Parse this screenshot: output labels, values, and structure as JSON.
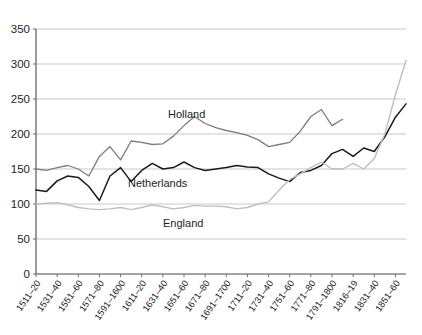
{
  "figure": {
    "cropped_caption_bleed": "                                                                                                 ",
    "background": "#ffffff"
  },
  "chart_data": {
    "type": "line",
    "title": "",
    "subtitle": "",
    "xlabel": "",
    "ylabel": "",
    "ylim": [
      0,
      350
    ],
    "ytick_step": 50,
    "yticks": [
      0,
      50,
      100,
      150,
      200,
      250,
      300,
      350
    ],
    "ytick_labels": [
      "0",
      "50",
      "100",
      "150",
      "200",
      "250",
      "300",
      "350"
    ],
    "grid": "horizontal",
    "legend_position": "inline-annotations",
    "x_tick_labels": [
      "1511–20",
      "1531–40",
      "1551–60",
      "1571–80",
      "1591–1600",
      "1611–20",
      "1631–40",
      "1651–60",
      "1671–80",
      "1691–1700",
      "1711–20",
      "1731–40",
      "1751–60",
      "1771–80",
      "1791–1800",
      "1816–19",
      "1831–40",
      "1851–60"
    ],
    "x_points_per_label": 2,
    "n_points": 36,
    "series": [
      {
        "name": "Holland",
        "color": "#7d7d7d",
        "width": 1.3,
        "label_x_px": 168,
        "label_y_px": 118,
        "n_values": 30,
        "values": [
          150,
          148,
          152,
          155,
          150,
          140,
          168,
          182,
          163,
          190,
          188,
          185,
          186,
          197,
          212,
          225,
          215,
          209,
          205,
          202,
          198,
          192,
          182,
          185,
          188,
          204,
          225,
          235,
          212,
          221
        ]
      },
      {
        "name": "Netherlands",
        "color": "#1a1a1a",
        "width": 1.5,
        "label_x_px": 128,
        "label_y_px": 187,
        "n_values": 36,
        "values": [
          120,
          118,
          133,
          140,
          138,
          125,
          105,
          140,
          152,
          132,
          148,
          158,
          150,
          152,
          160,
          152,
          148,
          150,
          152,
          155,
          153,
          152,
          143,
          137,
          132,
          145,
          148,
          155,
          172,
          178,
          168,
          180,
          175,
          196,
          224,
          243
        ]
      },
      {
        "name": "England",
        "color": "#bfbfbf",
        "width": 1.4,
        "label_x_px": 163,
        "label_y_px": 227,
        "n_values": 36,
        "values": [
          100,
          101,
          102,
          99,
          95,
          93,
          92,
          93,
          95,
          92,
          95,
          99,
          96,
          93,
          95,
          98,
          97,
          97,
          96,
          93,
          95,
          100,
          103,
          120,
          135,
          143,
          152,
          160,
          150,
          150,
          158,
          150,
          165,
          200,
          256,
          305
        ]
      }
    ],
    "annotations": [
      {
        "text": "Holland",
        "series": "Holland"
      },
      {
        "text": "Netherlands",
        "series": "Netherlands"
      },
      {
        "text": "England",
        "series": "England"
      }
    ]
  },
  "plot_geometry": {
    "left_px": 36,
    "right_px": 406,
    "top_px": 29,
    "bottom_px": 274
  }
}
